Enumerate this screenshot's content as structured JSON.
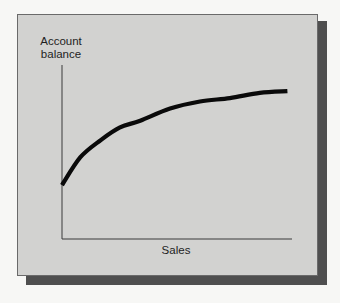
{
  "figure": {
    "colors": {
      "background": "#f7f7f5",
      "panel": "#d2d2d0",
      "panel_border": "#6a6a6a",
      "shadow": "#4f4f4f",
      "axis": "#3a3a3a",
      "curve": "#0a0a0a",
      "text": "#1e1e1e"
    }
  },
  "chart_data": {
    "type": "line",
    "title": "",
    "xlabel": "Sales",
    "ylabel_lines": [
      "Account",
      "balance"
    ],
    "ylabel": "Account balance",
    "x_ticks": [],
    "y_ticks": [],
    "grid": false,
    "legend": null,
    "axis_range_relative": {
      "x": [
        0,
        1
      ],
      "y": [
        0,
        1
      ]
    },
    "series": [
      {
        "name": "Account balance",
        "x": [
          0.0,
          0.08,
          0.17,
          0.25,
          0.34,
          0.47,
          0.6,
          0.73,
          0.86,
          0.98
        ],
        "values": [
          0.31,
          0.47,
          0.57,
          0.64,
          0.68,
          0.75,
          0.79,
          0.81,
          0.84,
          0.85
        ]
      }
    ]
  }
}
